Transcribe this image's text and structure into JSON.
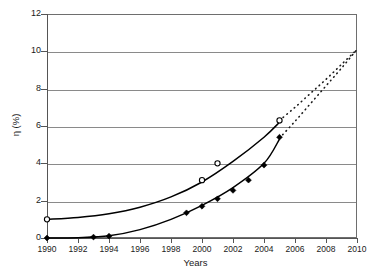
{
  "chart_data": {
    "type": "scatter",
    "title": "",
    "subtitle": "",
    "xlabel": "Years",
    "ylabel": "η (%)",
    "xlim": [
      1990,
      2010
    ],
    "ylim": [
      0,
      12
    ],
    "xticks": [
      1990,
      1992,
      1994,
      1996,
      1998,
      2000,
      2002,
      2004,
      2006,
      2008,
      2010
    ],
    "yticks": [
      0,
      2,
      4,
      6,
      8,
      10,
      12
    ],
    "xtick_labels": [
      "1990",
      "1992",
      "1994",
      "1996",
      "1998",
      "2000",
      "2002",
      "2004",
      "2006",
      "2008",
      "2010"
    ],
    "ytick_labels": [
      "0",
      "2",
      "4",
      "6",
      "8",
      "10",
      "12"
    ],
    "grid": "horizontal",
    "grid_color": "#8a8a8a",
    "frame_color": "#6e6e6e",
    "legend": "none",
    "legend_position": "none",
    "annotations": [],
    "series": [
      {
        "name": "upper-series",
        "marker": "open-circle",
        "marker_color": "#ffffff",
        "line_color": "#000000",
        "points": [
          {
            "x": 1990,
            "y": 1.0
          },
          {
            "x": 2000,
            "y": 3.1
          },
          {
            "x": 2001,
            "y": 4.0
          },
          {
            "x": 2005,
            "y": 6.3
          }
        ],
        "fit_curve": [
          {
            "x": 1990,
            "y": 1.0
          },
          {
            "x": 1992,
            "y": 1.1
          },
          {
            "x": 1994,
            "y": 1.3
          },
          {
            "x": 1996,
            "y": 1.65
          },
          {
            "x": 1998,
            "y": 2.2
          },
          {
            "x": 2000,
            "y": 3.0
          },
          {
            "x": 2002,
            "y": 4.1
          },
          {
            "x": 2004,
            "y": 5.4
          },
          {
            "x": 2005,
            "y": 6.2
          }
        ],
        "extrapolation": [
          {
            "x": 2005,
            "y": 6.3
          },
          {
            "x": 2006,
            "y": 7.0
          },
          {
            "x": 2007,
            "y": 7.75
          },
          {
            "x": 2008,
            "y": 8.5
          },
          {
            "x": 2009,
            "y": 9.3
          },
          {
            "x": 2010,
            "y": 10.1
          }
        ],
        "extrapolation_style": "dotted"
      },
      {
        "name": "lower-series",
        "marker": "filled-diamond",
        "marker_color": "#000000",
        "line_color": "#000000",
        "points": [
          {
            "x": 1990,
            "y": 0.0
          },
          {
            "x": 1993,
            "y": 0.05
          },
          {
            "x": 1994,
            "y": 0.1
          },
          {
            "x": 1999,
            "y": 1.35
          },
          {
            "x": 2000,
            "y": 1.7
          },
          {
            "x": 2001,
            "y": 2.1
          },
          {
            "x": 2002,
            "y": 2.55
          },
          {
            "x": 2003,
            "y": 3.1
          },
          {
            "x": 2004,
            "y": 3.9
          },
          {
            "x": 2005,
            "y": 5.4
          }
        ],
        "fit_curve": [
          {
            "x": 1990,
            "y": 0.0
          },
          {
            "x": 1992,
            "y": 0.02
          },
          {
            "x": 1994,
            "y": 0.12
          },
          {
            "x": 1996,
            "y": 0.45
          },
          {
            "x": 1998,
            "y": 1.0
          },
          {
            "x": 2000,
            "y": 1.75
          },
          {
            "x": 2002,
            "y": 2.7
          },
          {
            "x": 2004,
            "y": 4.0
          },
          {
            "x": 2005,
            "y": 5.3
          }
        ],
        "extrapolation": [
          {
            "x": 2005,
            "y": 5.35
          },
          {
            "x": 2006,
            "y": 6.25
          },
          {
            "x": 2007,
            "y": 7.2
          },
          {
            "x": 2008,
            "y": 8.15
          },
          {
            "x": 2009,
            "y": 9.1
          },
          {
            "x": 2010,
            "y": 10.1
          }
        ],
        "extrapolation_style": "dotted"
      }
    ]
  }
}
